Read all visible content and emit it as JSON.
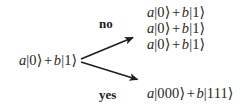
{
  "figure": {
    "type": "branching-decision-diagram",
    "background_color": "#ffffff",
    "text_color": "#2a2a2a",
    "width": 245,
    "height": 111
  },
  "input": {
    "label": "a|0⟩ + b|1⟩",
    "coefficient_a": "a",
    "ket_a": "|0⟩",
    "operator": "+",
    "coefficient_b": "b",
    "ket_b": "|1⟩"
  },
  "branches": [
    {
      "id": "no",
      "label": "no",
      "bold": true,
      "arrow": {
        "from": [
          80,
          60
        ],
        "to": [
          136,
          36
        ],
        "color": "#1d1d1d"
      },
      "outputs": [
        "a|0⟩ + b|1⟩",
        "a|0⟩ + b|1⟩",
        "a|0⟩ + b|1⟩"
      ]
    },
    {
      "id": "yes",
      "label": "yes",
      "bold": true,
      "arrow": {
        "from": [
          80,
          60
        ],
        "to": [
          141,
          81
        ],
        "color": "#1d1d1d"
      },
      "outputs": [
        "a|000⟩ + b|111⟩"
      ]
    }
  ],
  "outputs_no": {
    "line0": {
      "a": "a",
      "ket_a": "|0⟩",
      "op": "+",
      "b": "b",
      "ket_b": "|1⟩"
    },
    "line1": {
      "a": "a",
      "ket_a": "|0⟩",
      "op": "+",
      "b": "b",
      "ket_b": "|1⟩"
    },
    "line2": {
      "a": "a",
      "ket_a": "|0⟩",
      "op": "+",
      "b": "b",
      "ket_b": "|1⟩"
    }
  },
  "outputs_yes": {
    "line0": {
      "a": "a",
      "ket_a": "|000⟩",
      "op": "+",
      "b": "b",
      "ket_b": "|111⟩"
    }
  },
  "labels": {
    "no": "no",
    "yes": "yes"
  }
}
